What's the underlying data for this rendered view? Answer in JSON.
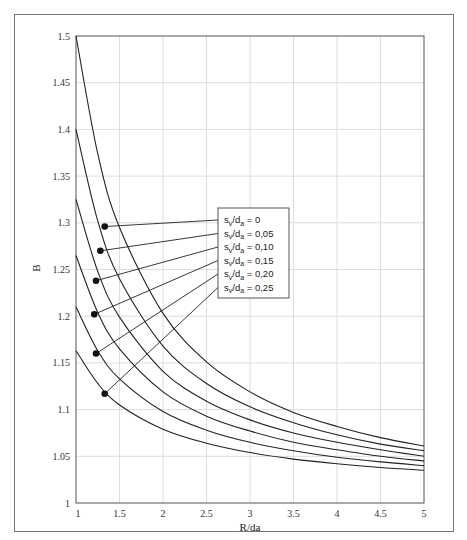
{
  "chart_data": {
    "type": "line",
    "title": "",
    "xlabel": "R/da",
    "ylabel": "B",
    "xlim": [
      1,
      5
    ],
    "ylim": [
      1,
      1.5
    ],
    "grid": true,
    "x_ticks": [
      "1",
      "1.5",
      "2",
      "2.5",
      "3",
      "3.5",
      "4",
      "4.5",
      "5"
    ],
    "y_ticks": [
      "1",
      "1.05",
      "1.1",
      "1.15",
      "1.2",
      "1.25",
      "1.3",
      "1.35",
      "1.4",
      "1.45",
      "1.5"
    ],
    "legend_position": "inside-center",
    "x": [
      1,
      1.25,
      1.5,
      2,
      2.5,
      3,
      3.5,
      4,
      4.5,
      5
    ],
    "series": [
      {
        "name": "s_v/d_a = 0",
        "values": [
          1.5,
          1.374,
          1.295,
          1.203,
          1.151,
          1.119,
          1.097,
          1.082,
          1.07,
          1.061
        ],
        "marker": [
          1.33,
          1.296
        ]
      },
      {
        "name": "s_v/d_a = 0,05",
        "values": [
          1.4,
          1.302,
          1.24,
          1.168,
          1.128,
          1.103,
          1.086,
          1.073,
          1.063,
          1.056
        ],
        "marker": [
          1.28,
          1.27
        ]
      },
      {
        "name": "s_v/d_a = 0,10",
        "values": [
          1.325,
          1.248,
          1.199,
          1.141,
          1.109,
          1.089,
          1.075,
          1.065,
          1.057,
          1.05
        ],
        "marker": [
          1.23,
          1.238
        ]
      },
      {
        "name": "s_v/d_a = 0,15",
        "values": [
          1.265,
          1.204,
          1.165,
          1.119,
          1.093,
          1.077,
          1.065,
          1.057,
          1.05,
          1.045
        ],
        "marker": [
          1.21,
          1.202
        ]
      },
      {
        "name": "s_v/d_a = 0,20",
        "values": [
          1.21,
          1.163,
          1.133,
          1.098,
          1.078,
          1.065,
          1.056,
          1.049,
          1.044,
          1.04
        ],
        "marker": [
          1.23,
          1.16
        ]
      },
      {
        "name": "s_v/d_a = 0,25",
        "values": [
          1.163,
          1.128,
          1.105,
          1.079,
          1.064,
          1.054,
          1.047,
          1.042,
          1.038,
          1.035
        ],
        "marker": [
          1.33,
          1.117
        ]
      }
    ],
    "legend": {
      "entries": [
        "s_v/d_a = 0",
        "s_v/d_a = 0,05",
        "s_v/d_a = 0,10",
        "s_v/d_a = 0,15",
        "s_v/d_a = 0,20",
        "s_v/d_a = 0,25"
      ]
    }
  },
  "legend_labels": [
    {
      "main": "s",
      "sub1": "v",
      "mid": "/d",
      "sub2": "a",
      "val": " = 0"
    },
    {
      "main": "s",
      "sub1": "v",
      "mid": "/d",
      "sub2": "a",
      "val": " = 0,05"
    },
    {
      "main": "s",
      "sub1": "v",
      "mid": "/d",
      "sub2": "a",
      "val": " = 0,10"
    },
    {
      "main": "s",
      "sub1": "v",
      "mid": "/d",
      "sub2": "a",
      "val": " = 0,15"
    },
    {
      "main": "s",
      "sub1": "v",
      "mid": "/d",
      "sub2": "a",
      "val": " = 0,20"
    },
    {
      "main": "s",
      "sub1": "v",
      "mid": "/d",
      "sub2": "a",
      "val": " = 0,25"
    }
  ],
  "colors": {
    "line": "#222222",
    "grid": "#dddddd",
    "axis": "#555555",
    "frame": "#777777"
  }
}
